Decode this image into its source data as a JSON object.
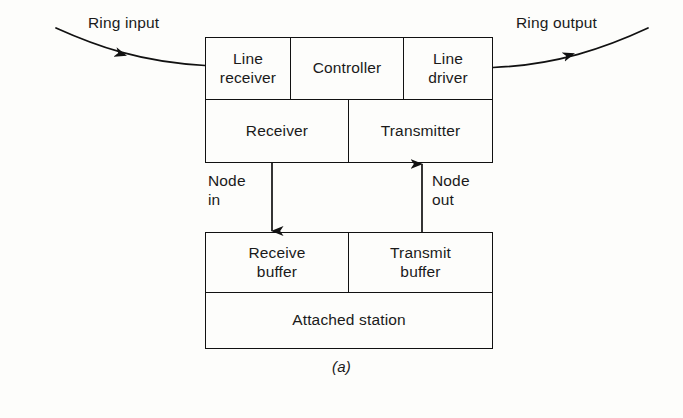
{
  "figure": {
    "caption": "(a)",
    "background_color": "#fdfdfb",
    "line_color": "#111111",
    "diagram_type": "block-diagram"
  },
  "ring": {
    "input_label": "Ring input",
    "output_label": "Ring output",
    "input_arrow_icon": "arrow-right-icon",
    "output_arrow_icon": "arrow-right-icon"
  },
  "node_interface": {
    "in_label": "Node\nin",
    "out_label": "Node\nout",
    "in_arrow_icon": "arrow-down-icon",
    "out_arrow_icon": "arrow-up-icon"
  },
  "upper_unit": {
    "top_row": [
      {
        "label": "Line\nreceiver"
      },
      {
        "label": "Controller"
      },
      {
        "label": "Line\ndriver"
      }
    ],
    "bottom_row": [
      {
        "label": "Receiver"
      },
      {
        "label": "Transmitter"
      }
    ]
  },
  "lower_unit": {
    "buffer_row": [
      {
        "label": "Receive\nbuffer"
      },
      {
        "label": "Transmit\nbuffer"
      }
    ],
    "station": {
      "label": "Attached station"
    }
  }
}
